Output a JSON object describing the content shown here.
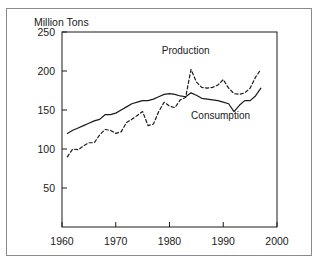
{
  "figure": {
    "y_axis_title": "Million Tons",
    "border_color": "#8b8b8b",
    "line_color": "#1a1a1a",
    "background": "#ffffff"
  },
  "chart_data": {
    "type": "line",
    "title": "",
    "subtitle": "",
    "xlabel": "",
    "ylabel": "Million Tons",
    "xlim": [
      1960,
      2000
    ],
    "ylim": [
      0,
      250
    ],
    "xticks": [
      1960,
      1970,
      1980,
      1990,
      2000
    ],
    "yticks": [
      50,
      100,
      150,
      200,
      250
    ],
    "xtick_labels": [
      "1960",
      "1970",
      "1980",
      "1990",
      "2000"
    ],
    "ytick_labels": [
      "50",
      "100",
      "150",
      "200",
      "250"
    ],
    "grid": false,
    "legend": "inline-annotations",
    "annotations": [
      {
        "text": "Production",
        "x": 1983.0,
        "y": 222
      },
      {
        "text": "Consumption",
        "x": 1989.5,
        "y": 139
      }
    ],
    "series": [
      {
        "name": "Consumption",
        "style": "solid",
        "x": [
          1961,
          1962,
          1963,
          1964,
          1965,
          1966,
          1967,
          1968,
          1969,
          1970,
          1971,
          1972,
          1973,
          1974,
          1975,
          1976,
          1977,
          1978,
          1979,
          1980,
          1981,
          1982,
          1983,
          1984,
          1985,
          1986,
          1987,
          1988,
          1989,
          1990,
          1991,
          1992,
          1993,
          1994,
          1995,
          1996,
          1997
        ],
        "values": [
          120,
          124,
          127,
          130,
          133,
          136,
          138,
          144,
          144,
          146,
          150,
          154,
          158,
          160,
          162,
          162,
          164,
          167,
          170,
          171,
          170,
          168,
          167,
          172,
          169,
          165,
          164,
          163,
          162,
          160,
          158,
          148,
          156,
          162,
          162,
          168,
          178
        ]
      },
      {
        "name": "Production",
        "style": "dashed",
        "x": [
          1961,
          1962,
          1963,
          1964,
          1965,
          1966,
          1967,
          1968,
          1969,
          1970,
          1971,
          1972,
          1973,
          1974,
          1975,
          1976,
          1977,
          1978,
          1979,
          1980,
          1981,
          1982,
          1983,
          1984,
          1985,
          1986,
          1987,
          1988,
          1989,
          1990,
          1991,
          1992,
          1993,
          1994,
          1995,
          1996,
          1997
        ],
        "values": [
          90,
          100,
          99,
          104,
          108,
          108,
          118,
          125,
          124,
          120,
          122,
          134,
          138,
          143,
          148,
          130,
          132,
          148,
          160,
          155,
          153,
          163,
          166,
          202,
          186,
          179,
          178,
          179,
          182,
          189,
          178,
          171,
          170,
          172,
          178,
          192,
          202
        ]
      }
    ]
  }
}
